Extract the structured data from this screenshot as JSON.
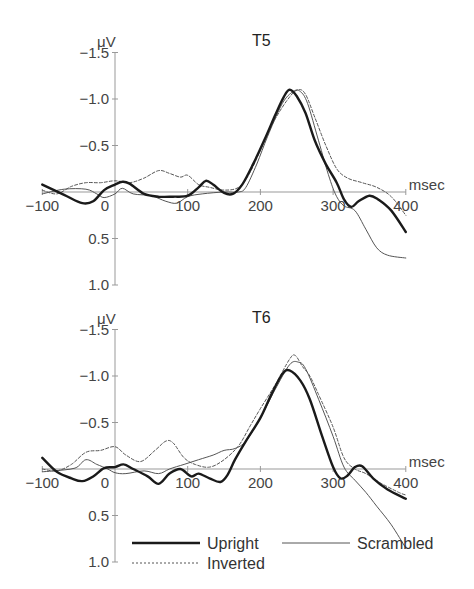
{
  "chart_data": [
    {
      "type": "line",
      "title": "T5",
      "ylabel": "μV",
      "xlabel": "msec",
      "xlim": [
        -100,
        400
      ],
      "ylim": [
        1.0,
        -1.5
      ],
      "y_inverted": true,
      "xticks": [
        -100,
        0,
        100,
        200,
        300,
        400
      ],
      "yticks": [
        -1.5,
        -1.0,
        -0.5,
        0.5,
        1.0
      ],
      "ytick_labels": [
        "−1.5",
        "−1.0",
        "−0.5",
        "0.5",
        "1.0"
      ],
      "xtick_labels": [
        "−100",
        "0",
        "100",
        "200",
        "300",
        "400"
      ],
      "series": [
        {
          "name": "Upright",
          "style": "thick-solid",
          "x": [
            -100,
            -70,
            -45,
            -30,
            -15,
            0,
            10,
            20,
            40,
            60,
            80,
            100,
            115,
            125,
            135,
            150,
            162,
            175,
            190,
            205,
            220,
            232,
            240,
            250,
            262,
            275,
            290,
            305,
            315,
            325,
            335,
            350,
            362,
            380,
            400
          ],
          "values": [
            -0.08,
            0.03,
            0.12,
            0.1,
            -0.02,
            -0.08,
            -0.11,
            -0.09,
            0.02,
            0.05,
            0.05,
            0.04,
            -0.05,
            -0.12,
            -0.08,
            0.01,
            0.02,
            -0.08,
            -0.3,
            -0.55,
            -0.82,
            -1.02,
            -1.1,
            -1.03,
            -0.85,
            -0.55,
            -0.3,
            -0.1,
            0.08,
            0.16,
            0.1,
            0.04,
            0.08,
            0.2,
            0.43
          ]
        },
        {
          "name": "Inverted",
          "style": "dashed",
          "x": [
            -100,
            -80,
            -60,
            -40,
            -20,
            0,
            20,
            40,
            60,
            75,
            90,
            100,
            115,
            130,
            150,
            170,
            185,
            200,
            220,
            240,
            252,
            262,
            275,
            290,
            305,
            320,
            340,
            360,
            380,
            400
          ],
          "values": [
            -0.02,
            0.02,
            -0.06,
            -0.1,
            -0.1,
            -0.12,
            -0.1,
            -0.15,
            -0.23,
            -0.2,
            -0.16,
            -0.18,
            -0.08,
            -0.05,
            -0.02,
            -0.05,
            -0.2,
            -0.45,
            -0.78,
            -1.02,
            -1.1,
            -1.05,
            -0.8,
            -0.5,
            -0.25,
            -0.15,
            -0.1,
            -0.05,
            0.05,
            0.25
          ]
        },
        {
          "name": "Scrambled",
          "style": "thin-solid",
          "x": [
            -100,
            -70,
            -40,
            -25,
            -15,
            0,
            10,
            25,
            50,
            70,
            85,
            100,
            120,
            150,
            170,
            180,
            195,
            210,
            230,
            245,
            255,
            265,
            280,
            295,
            305,
            315,
            330,
            345,
            360,
            375,
            400
          ],
          "values": [
            0.02,
            -0.03,
            -0.03,
            0.02,
            0.06,
            0.02,
            -0.04,
            0.02,
            0.04,
            0.1,
            0.12,
            0.05,
            0.02,
            0.0,
            0.0,
            -0.05,
            -0.3,
            -0.6,
            -0.95,
            -1.08,
            -1.08,
            -0.95,
            -0.55,
            -0.15,
            0.05,
            0.15,
            0.2,
            0.4,
            0.6,
            0.68,
            0.71
          ]
        }
      ]
    },
    {
      "type": "line",
      "title": "T6",
      "ylabel": "μV",
      "xlabel": "msec",
      "xlim": [
        -100,
        400
      ],
      "ylim": [
        1.0,
        -1.5
      ],
      "y_inverted": true,
      "xticks": [
        -100,
        0,
        100,
        200,
        300,
        400
      ],
      "yticks": [
        -1.5,
        -1.0,
        -0.5,
        0.5,
        1.0
      ],
      "ytick_labels": [
        "−1.5",
        "−1.0",
        "−0.5",
        "0.5",
        "1.0"
      ],
      "xtick_labels": [
        "−100",
        "0",
        "100",
        "200",
        "300",
        "400"
      ],
      "series": [
        {
          "name": "Upright",
          "style": "thick-solid",
          "x": [
            -100,
            -80,
            -60,
            -45,
            -30,
            -15,
            0,
            12,
            25,
            45,
            60,
            75,
            90,
            105,
            115,
            130,
            145,
            155,
            165,
            180,
            200,
            215,
            230,
            240,
            255,
            268,
            285,
            300,
            310,
            320,
            330,
            340,
            355,
            375,
            400
          ],
          "values": [
            -0.12,
            0.03,
            0.1,
            0.13,
            0.08,
            -0.01,
            -0.02,
            -0.05,
            0.0,
            0.08,
            0.16,
            0.05,
            0.0,
            0.08,
            0.05,
            0.1,
            0.14,
            0.06,
            -0.1,
            -0.3,
            -0.55,
            -0.8,
            -1.02,
            -1.06,
            -0.95,
            -0.75,
            -0.35,
            -0.02,
            0.1,
            0.07,
            -0.02,
            -0.03,
            0.1,
            0.22,
            0.32
          ]
        },
        {
          "name": "Inverted",
          "style": "dashed",
          "x": [
            -100,
            -80,
            -60,
            -40,
            -20,
            0,
            15,
            35,
            55,
            70,
            80,
            95,
            110,
            130,
            150,
            170,
            185,
            200,
            220,
            240,
            248,
            258,
            268,
            280,
            300,
            315,
            330,
            345,
            365,
            390,
            400
          ],
          "values": [
            0.0,
            0.02,
            -0.05,
            -0.18,
            -0.2,
            -0.24,
            -0.15,
            -0.08,
            -0.2,
            -0.3,
            -0.28,
            -0.12,
            -0.05,
            -0.02,
            -0.1,
            -0.25,
            -0.45,
            -0.65,
            -0.9,
            -1.18,
            -1.22,
            -1.1,
            -1.0,
            -0.8,
            -0.45,
            -0.12,
            0.0,
            0.05,
            0.15,
            0.25,
            0.28
          ]
        },
        {
          "name": "Scrambled",
          "style": "thin-solid",
          "x": [
            -100,
            -85,
            -55,
            -40,
            -25,
            -10,
            0,
            15,
            40,
            60,
            75,
            95,
            115,
            135,
            150,
            165,
            180,
            200,
            220,
            240,
            252,
            262,
            280,
            300,
            315,
            330,
            345,
            360,
            380,
            400
          ],
          "values": [
            0.03,
            0.02,
            -0.01,
            -0.1,
            -0.05,
            0.0,
            0.04,
            0.05,
            0.02,
            0.05,
            0.0,
            -0.05,
            -0.1,
            -0.15,
            -0.2,
            -0.22,
            -0.3,
            -0.55,
            -0.85,
            -1.12,
            -1.15,
            -1.08,
            -0.75,
            -0.35,
            -0.02,
            0.12,
            0.25,
            0.4,
            0.6,
            0.85
          ]
        }
      ]
    }
  ],
  "legend": {
    "position": "bottom",
    "items": [
      {
        "label": "Upright",
        "style": "thick-solid"
      },
      {
        "label": "Scrambled",
        "style": "thin-solid"
      },
      {
        "label": "Inverted",
        "style": "dashed"
      }
    ]
  },
  "labels": {
    "unit": "μV",
    "xunit": "msec",
    "panel_titles": [
      "T5",
      "T6"
    ],
    "legend_upright": "Upright",
    "legend_scrambled": "Scrambled",
    "legend_inverted": "Inverted"
  },
  "colors": {
    "upright": "#1a1a1a",
    "scrambled": "#555555",
    "inverted": "#555555",
    "axis": "#999999"
  }
}
